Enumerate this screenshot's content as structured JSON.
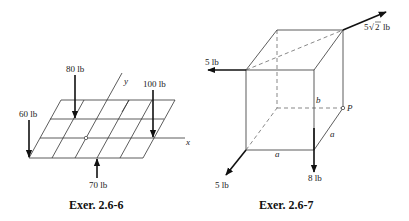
{
  "figures": [
    {
      "id": "exer-2-6-6",
      "caption": "Exer. 2.6-6",
      "axes": {
        "x": "x",
        "y": "y"
      },
      "forces": [
        {
          "label": "80 lb",
          "direction": "down"
        },
        {
          "label": "100 lb",
          "direction": "down"
        },
        {
          "label": "60 lb",
          "direction": "down"
        },
        {
          "label": "70 lb",
          "direction": "up"
        }
      ]
    },
    {
      "id": "exer-2-6-7",
      "caption": "Exer. 2.6-7",
      "forces": [
        {
          "label_main": "5",
          "label_sqrt": "2",
          "label_unit": "lb",
          "direction": "up-right"
        },
        {
          "label": "5 lb",
          "direction": "left"
        },
        {
          "label": "5 lb",
          "direction": "down-left"
        },
        {
          "label": "8 lb",
          "direction": "down"
        }
      ],
      "dimensions": {
        "a_bottom": "a",
        "a_side": "a",
        "b": "b"
      },
      "point": "P"
    }
  ]
}
